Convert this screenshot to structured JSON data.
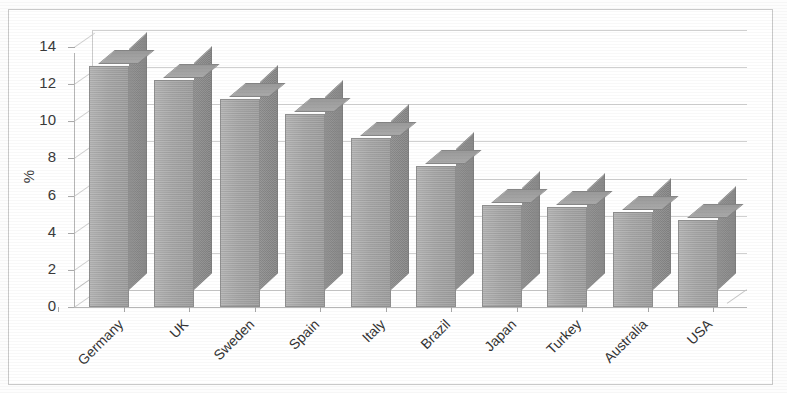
{
  "chart_data": {
    "type": "bar",
    "title": "",
    "subtitle": "",
    "xlabel": "",
    "ylabel": "%",
    "categories": [
      "Germany",
      "UK",
      "Sweden",
      "Spain",
      "Italy",
      "Brazil",
      "Japan",
      "Turkey",
      "Australia",
      "USA"
    ],
    "values": [
      13.0,
      12.2,
      11.2,
      10.4,
      9.1,
      7.6,
      5.5,
      5.4,
      5.1,
      4.7
    ],
    "ylim": [
      0,
      14
    ],
    "ytick_labels": [
      "0",
      "2",
      "4",
      "6",
      "8",
      "10",
      "12",
      "14"
    ],
    "ytick_values": [
      0,
      2,
      4,
      6,
      8,
      10,
      12,
      14
    ],
    "grid": true,
    "grid_axis": "y",
    "legend": "none",
    "style": "3d-column",
    "bar_color": "#a6a6a6",
    "bar_side_color": "#8a8a8a",
    "bar_top_color": "#9f9f9f",
    "grid_color": "#d0d0d0",
    "axis_color": "#b6b6b6",
    "text_color": "#333333",
    "background": "#ffffff"
  },
  "axis": {
    "y_label": "%"
  }
}
